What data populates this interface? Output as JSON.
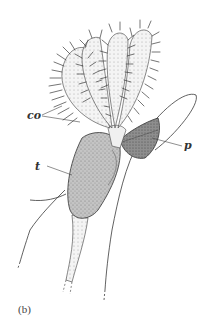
{
  "figure": {
    "caption": "(b)",
    "labels": {
      "co": "co",
      "p": "p",
      "t": "t"
    },
    "colors": {
      "ink": "#3a3a3a",
      "tentacle_fill": "#e8e8e8",
      "body_fill": "#b8b8b8",
      "pouch_fill": "#8a8a8a",
      "background": "#ffffff"
    }
  }
}
